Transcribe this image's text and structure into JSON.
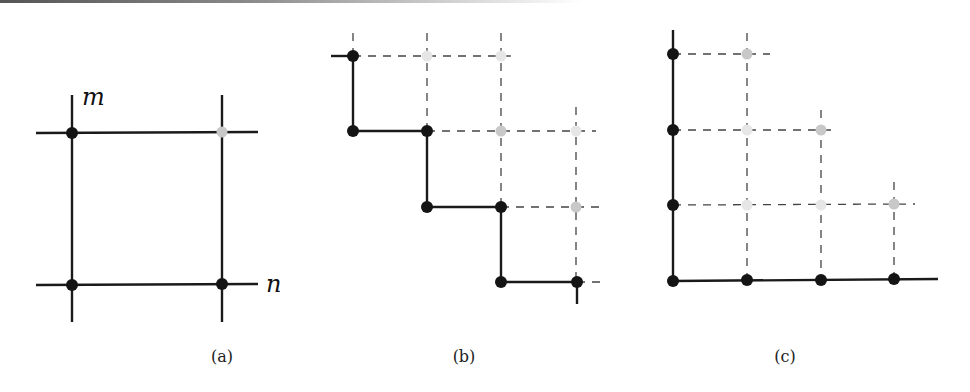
{
  "colors": {
    "black_dot": "#141414",
    "gray_dot": "#c8c8c8",
    "light_dot": "#e6e6e6",
    "line": "#1a1a1a",
    "dash": "#444444"
  },
  "panels": [
    {
      "id": "a",
      "caption": "(a)",
      "caption_pos": [
        222,
        362
      ],
      "labels": [
        {
          "text": "m",
          "x": 82,
          "y": 105
        },
        {
          "text": "n",
          "x": 266,
          "y": 292
        }
      ],
      "solid": [
        [
          72,
          95,
          72,
          322
        ],
        [
          222,
          95,
          222,
          322
        ],
        [
          36,
          133,
          258,
          132
        ],
        [
          36,
          285,
          258,
          284
        ]
      ],
      "dashed": [],
      "dots": [
        {
          "x": 72,
          "y": 133,
          "kind": "black"
        },
        {
          "x": 222,
          "y": 132,
          "kind": "gray"
        },
        {
          "x": 72,
          "y": 285,
          "kind": "black"
        },
        {
          "x": 222,
          "y": 284,
          "kind": "black"
        }
      ]
    },
    {
      "id": "b",
      "caption": "(b)",
      "caption_pos": [
        464,
        362
      ],
      "labels": [],
      "solid": [
        [
          331,
          56,
          353,
          56
        ],
        [
          353,
          56,
          353,
          131
        ],
        [
          353,
          131,
          427,
          131
        ],
        [
          427,
          131,
          427,
          207
        ],
        [
          427,
          207,
          501,
          207
        ],
        [
          501,
          207,
          501,
          282
        ],
        [
          501,
          282,
          577,
          282
        ],
        [
          577,
          282,
          577,
          304
        ]
      ],
      "dashed": [
        [
          353,
          33,
          353,
          56
        ],
        [
          427,
          33,
          427,
          131
        ],
        [
          501,
          33,
          501,
          207
        ],
        [
          576,
          107,
          576,
          282
        ],
        [
          353,
          56,
          518,
          56
        ],
        [
          427,
          131,
          596,
          131
        ],
        [
          501,
          207,
          600,
          207
        ],
        [
          577,
          282,
          600,
          282
        ]
      ],
      "dots": [
        {
          "x": 353,
          "y": 56,
          "kind": "black"
        },
        {
          "x": 427,
          "y": 56,
          "kind": "light"
        },
        {
          "x": 501,
          "y": 56,
          "kind": "light"
        },
        {
          "x": 353,
          "y": 131,
          "kind": "black"
        },
        {
          "x": 427,
          "y": 131,
          "kind": "black"
        },
        {
          "x": 501,
          "y": 131,
          "kind": "gray"
        },
        {
          "x": 576,
          "y": 131,
          "kind": "light"
        },
        {
          "x": 427,
          "y": 207,
          "kind": "black"
        },
        {
          "x": 501,
          "y": 207,
          "kind": "black"
        },
        {
          "x": 576,
          "y": 207,
          "kind": "gray"
        },
        {
          "x": 501,
          "y": 282,
          "kind": "black"
        },
        {
          "x": 577,
          "y": 282,
          "kind": "black"
        }
      ]
    },
    {
      "id": "c",
      "caption": "(c)",
      "caption_pos": [
        785,
        362
      ],
      "labels": [],
      "solid": [
        [
          673,
          30,
          673,
          281
        ],
        [
          673,
          281,
          938,
          279
        ]
      ],
      "dashed": [
        [
          747,
          33,
          747,
          280
        ],
        [
          821,
          110,
          821,
          280
        ],
        [
          894,
          182,
          894,
          279
        ],
        [
          673,
          54,
          770,
          54
        ],
        [
          673,
          130,
          838,
          130
        ],
        [
          673,
          205,
          915,
          204
        ]
      ],
      "dots": [
        {
          "x": 673,
          "y": 54,
          "kind": "black"
        },
        {
          "x": 747,
          "y": 54,
          "kind": "gray"
        },
        {
          "x": 673,
          "y": 130,
          "kind": "black"
        },
        {
          "x": 747,
          "y": 130,
          "kind": "light"
        },
        {
          "x": 821,
          "y": 130,
          "kind": "gray"
        },
        {
          "x": 673,
          "y": 205,
          "kind": "black"
        },
        {
          "x": 747,
          "y": 205,
          "kind": "light"
        },
        {
          "x": 821,
          "y": 205,
          "kind": "light"
        },
        {
          "x": 894,
          "y": 204,
          "kind": "gray"
        },
        {
          "x": 673,
          "y": 281,
          "kind": "black"
        },
        {
          "x": 747,
          "y": 280,
          "kind": "black"
        },
        {
          "x": 821,
          "y": 280,
          "kind": "black"
        },
        {
          "x": 894,
          "y": 279,
          "kind": "black"
        }
      ]
    }
  ]
}
